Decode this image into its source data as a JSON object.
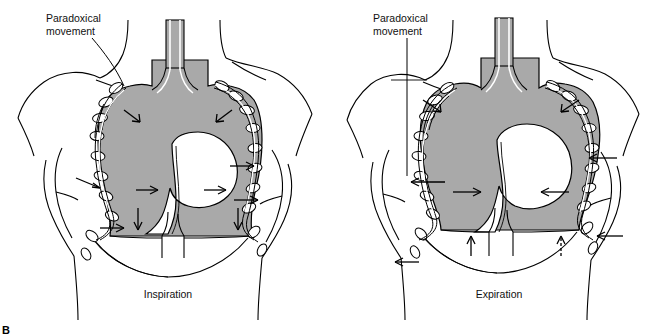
{
  "figure": {
    "panel_letter": "B"
  },
  "panels": [
    {
      "id": "inspiration",
      "caption": "Inspiration",
      "annotation": {
        "line1": "Paradoxical",
        "line2": "movement",
        "leader": "diagonal"
      },
      "arrows": [
        {
          "name": "left-upper-chest-inward",
          "direction": "down-right"
        },
        {
          "name": "right-upper-chest-inward",
          "direction": "down-left"
        },
        {
          "name": "left-lateral-flail-inward",
          "direction": "right"
        },
        {
          "name": "left-mid-inward",
          "direction": "right"
        },
        {
          "name": "right-mid-inward",
          "direction": "right"
        },
        {
          "name": "right-lateral-inward-upper",
          "direction": "right"
        },
        {
          "name": "right-lateral-inward-lower",
          "direction": "right"
        },
        {
          "name": "left-diaphragm-descent",
          "direction": "down"
        },
        {
          "name": "right-diaphragm-descent",
          "direction": "down"
        },
        {
          "name": "left-lower-flail-inward",
          "direction": "right"
        }
      ]
    },
    {
      "id": "expiration",
      "caption": "Expiration",
      "annotation": {
        "line1": "Paradoxical",
        "line2": "movement",
        "leader": "vertical"
      },
      "arrows": [
        {
          "name": "left-upper-chest-inward",
          "direction": "down-right"
        },
        {
          "name": "right-upper-chest-inward",
          "direction": "down-left"
        },
        {
          "name": "left-lateral-outward",
          "direction": "left"
        },
        {
          "name": "left-mid-inward",
          "direction": "right"
        },
        {
          "name": "right-mid-inward",
          "direction": "left"
        },
        {
          "name": "right-lateral-inward",
          "direction": "left"
        },
        {
          "name": "right-lower-inward",
          "direction": "left"
        },
        {
          "name": "left-diaphragm-ascent",
          "direction": "up"
        },
        {
          "name": "right-diaphragm-ascent",
          "direction": "up"
        },
        {
          "name": "left-lower-outward",
          "direction": "left"
        }
      ]
    }
  ],
  "anatomy": {
    "labels": [
      "trachea",
      "lung-field",
      "heart",
      "diaphragm",
      "rib-cage",
      "flail-segment",
      "clavicle",
      "torso-outline"
    ]
  },
  "colors": {
    "lung_fill": "#a9a9a9",
    "stroke": "#000000",
    "background": "#ffffff",
    "heart_fill": "#ffffff"
  }
}
